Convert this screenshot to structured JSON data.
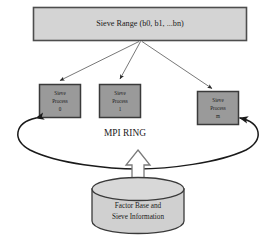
{
  "diagram": {
    "colors": {
      "range_box_fill": "#d4d4d4",
      "range_box_stroke": "#4d4d4d",
      "process_box_fill": "#9a9a9a",
      "process_box_stroke": "#3a3a3a",
      "cylinder_fill": "#d0d0d0",
      "cylinder_stroke": "#3a3a3a",
      "ring_stroke": "#1a1a1a",
      "arrow_stroke": "#4a4a4a",
      "block_arrow_fill": "#ffffff",
      "block_arrow_stroke": "#6a6a6a",
      "text": "#1a1a1a",
      "background": "#ffffff"
    },
    "range_box": {
      "label": "Sieve Range (b0, b1, ...bn)"
    },
    "processes": [
      {
        "line1": "Sieve",
        "line2": "Process",
        "line3": "0"
      },
      {
        "line1": "Sieve",
        "line2": "Process",
        "line3": "1"
      },
      {
        "line1": "Sieve",
        "line2": "Process",
        "line3": "m"
      }
    ],
    "ring": {
      "label": "MPI RING"
    },
    "datastore": {
      "line1": "Factor Base and",
      "line2": "Sieve Information"
    }
  }
}
